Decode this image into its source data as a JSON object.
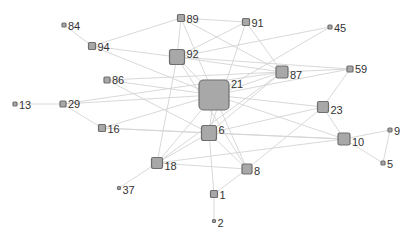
{
  "graph": {
    "colors": {
      "edge": "#d4d4d4",
      "node_fill": "#a8a8a8",
      "node_stroke": "#6e6e6e",
      "label": "#333333"
    },
    "nodes": [
      {
        "id": "84",
        "label": "84",
        "x": 64,
        "y": 25,
        "size": 4
      },
      {
        "id": "94",
        "label": "94",
        "x": 92,
        "y": 46,
        "size": 7
      },
      {
        "id": "89",
        "label": "89",
        "x": 181,
        "y": 18,
        "size": 7
      },
      {
        "id": "91",
        "label": "91",
        "x": 246,
        "y": 22,
        "size": 7
      },
      {
        "id": "45",
        "label": "45",
        "x": 330,
        "y": 27,
        "size": 4
      },
      {
        "id": "92",
        "label": "92",
        "x": 177,
        "y": 57,
        "size": 15
      },
      {
        "id": "87",
        "label": "87",
        "x": 282,
        "y": 72,
        "size": 12
      },
      {
        "id": "59",
        "label": "59",
        "x": 350,
        "y": 69,
        "size": 6
      },
      {
        "id": "86",
        "label": "86",
        "x": 107,
        "y": 80,
        "size": 6
      },
      {
        "id": "21",
        "label": "21",
        "x": 214,
        "y": 95,
        "size": 30
      },
      {
        "id": "13",
        "label": "13",
        "x": 15,
        "y": 104,
        "size": 4
      },
      {
        "id": "29",
        "label": "29",
        "x": 63,
        "y": 104,
        "size": 6
      },
      {
        "id": "23",
        "label": "23",
        "x": 323,
        "y": 107,
        "size": 11
      },
      {
        "id": "16",
        "label": "16",
        "x": 102,
        "y": 128,
        "size": 7
      },
      {
        "id": "6",
        "label": "6",
        "x": 209,
        "y": 133,
        "size": 15
      },
      {
        "id": "10",
        "label": "10",
        "x": 344,
        "y": 139,
        "size": 12
      },
      {
        "id": "9",
        "label": "9",
        "x": 390,
        "y": 130,
        "size": 4
      },
      {
        "id": "18",
        "label": "18",
        "x": 157,
        "y": 163,
        "size": 11
      },
      {
        "id": "8",
        "label": "8",
        "x": 247,
        "y": 169,
        "size": 10
      },
      {
        "id": "5",
        "label": "5",
        "x": 383,
        "y": 163,
        "size": 4
      },
      {
        "id": "37",
        "label": "37",
        "x": 119,
        "y": 188,
        "size": 3
      },
      {
        "id": "1",
        "label": "1",
        "x": 214,
        "y": 194,
        "size": 7
      },
      {
        "id": "2",
        "label": "2",
        "x": 214,
        "y": 221,
        "size": 3
      }
    ],
    "edges": [
      [
        "84",
        "94"
      ],
      [
        "94",
        "92"
      ],
      [
        "94",
        "21"
      ],
      [
        "94",
        "89"
      ],
      [
        "89",
        "91"
      ],
      [
        "89",
        "92"
      ],
      [
        "89",
        "21"
      ],
      [
        "89",
        "87"
      ],
      [
        "91",
        "92"
      ],
      [
        "91",
        "87"
      ],
      [
        "91",
        "6"
      ],
      [
        "45",
        "92"
      ],
      [
        "45",
        "21"
      ],
      [
        "92",
        "21"
      ],
      [
        "92",
        "87"
      ],
      [
        "92",
        "18"
      ],
      [
        "92",
        "8"
      ],
      [
        "92",
        "59"
      ],
      [
        "87",
        "21"
      ],
      [
        "87",
        "59"
      ],
      [
        "87",
        "6"
      ],
      [
        "87",
        "18"
      ],
      [
        "59",
        "21"
      ],
      [
        "59",
        "23"
      ],
      [
        "86",
        "21"
      ],
      [
        "86",
        "6"
      ],
      [
        "86",
        "87"
      ],
      [
        "13",
        "29"
      ],
      [
        "29",
        "21"
      ],
      [
        "29",
        "16"
      ],
      [
        "29",
        "87"
      ],
      [
        "21",
        "23"
      ],
      [
        "21",
        "6"
      ],
      [
        "21",
        "18"
      ],
      [
        "21",
        "8"
      ],
      [
        "21",
        "16"
      ],
      [
        "21",
        "10"
      ],
      [
        "23",
        "6"
      ],
      [
        "23",
        "10"
      ],
      [
        "23",
        "8"
      ],
      [
        "16",
        "6"
      ],
      [
        "16",
        "10"
      ],
      [
        "6",
        "10"
      ],
      [
        "6",
        "18"
      ],
      [
        "6",
        "1"
      ],
      [
        "6",
        "8"
      ],
      [
        "10",
        "9"
      ],
      [
        "10",
        "5"
      ],
      [
        "9",
        "5"
      ],
      [
        "10",
        "18"
      ],
      [
        "18",
        "37"
      ],
      [
        "18",
        "8"
      ],
      [
        "8",
        "1"
      ],
      [
        "1",
        "2"
      ]
    ]
  }
}
